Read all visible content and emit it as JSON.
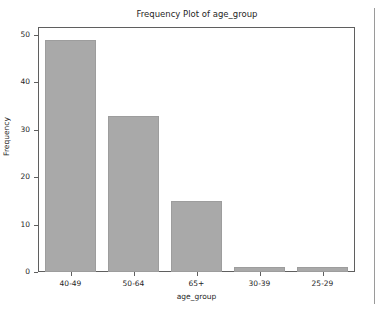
{
  "figure": {
    "background": "#ffffff",
    "axes_color": "#5f5f5f"
  },
  "panel": {
    "divider_name": "panel-divider"
  },
  "chart_data": {
    "type": "bar",
    "title": "Frequency Plot of age_group",
    "xlabel": "age_group",
    "ylabel": "Frequency",
    "categories": [
      "40-49",
      "50-64",
      "65+",
      "30-39",
      "25-29"
    ],
    "values": [
      49,
      33,
      15,
      1,
      1
    ],
    "ylim": [
      0,
      51.45
    ],
    "yticks": [
      0,
      10,
      20,
      30,
      40,
      50
    ],
    "ytick_labels": [
      "0",
      "10",
      "20",
      "30",
      "40",
      "50"
    ],
    "grid": false,
    "legend": null,
    "bar_color": "#a9a9a9",
    "bar_edge_color": "#9d9d9d"
  }
}
